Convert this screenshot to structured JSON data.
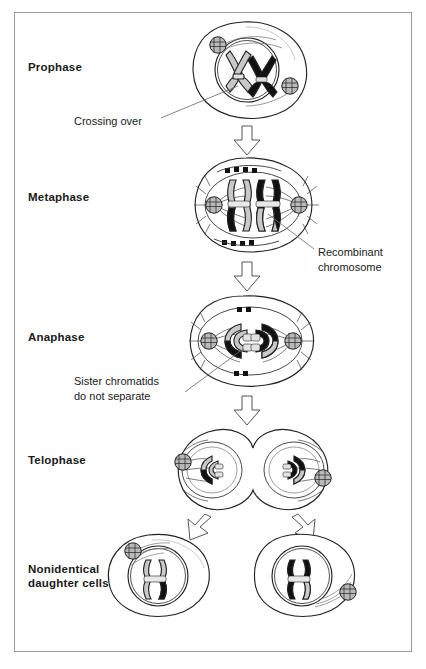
{
  "figure": {
    "background_color": "#ffffff",
    "border_color": "#9a9a9a",
    "ink_color": "#1a1a1a",
    "chromosome_colors": {
      "maternal": "#c9c9c9",
      "paternal": "#111111",
      "centromere": "#d8d8d8"
    }
  },
  "stages": [
    {
      "id": "prophase",
      "label": "Prophase"
    },
    {
      "id": "metaphase",
      "label": "Metaphase"
    },
    {
      "id": "anaphase",
      "label": "Anaphase"
    },
    {
      "id": "telophase",
      "label": "Telophase"
    },
    {
      "id": "daughters",
      "label": "Nonidentical\ndaughter cells",
      "line1": "Nonidentical",
      "line2": "daughter cells"
    }
  ],
  "callouts": [
    {
      "id": "crossing-over",
      "text": "Crossing over"
    },
    {
      "id": "recombinant",
      "line1": "Recombinant",
      "line2": "chromosome"
    },
    {
      "id": "sister-chromatids",
      "line1": "Sister chromatids",
      "line2": "do not separate"
    }
  ],
  "arrows": [
    {
      "id": "prophase-to-metaphase",
      "direction": "down"
    },
    {
      "id": "metaphase-to-anaphase",
      "direction": "down"
    },
    {
      "id": "anaphase-to-telophase",
      "direction": "down"
    },
    {
      "id": "telophase-to-daughter-left",
      "direction": "down-left"
    },
    {
      "id": "telophase-to-daughter-right",
      "direction": "down-right"
    }
  ]
}
